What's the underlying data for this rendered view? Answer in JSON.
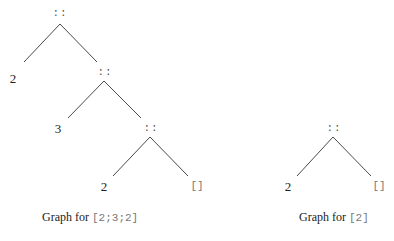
{
  "figures": [
    {
      "id": "tree-left",
      "caption": {
        "prefix": "Graph for ",
        "code": "[2;3;2]"
      },
      "nodes": [
        {
          "label": "::",
          "kind": "cons"
        },
        {
          "label": "2",
          "kind": "num"
        },
        {
          "label": "::",
          "kind": "cons"
        },
        {
          "label": "3",
          "kind": "num"
        },
        {
          "label": "::",
          "kind": "cons"
        },
        {
          "label": "2",
          "kind": "num"
        },
        {
          "label": "[]",
          "kind": "nil"
        }
      ]
    },
    {
      "id": "tree-right",
      "caption": {
        "prefix": "Graph for ",
        "code": "[2]"
      },
      "nodes": [
        {
          "label": "::",
          "kind": "cons"
        },
        {
          "label": "2",
          "kind": "num"
        },
        {
          "label": "[]",
          "kind": "nil"
        }
      ]
    }
  ],
  "colors": {
    "edge": "#4a4a4a",
    "text": "#222222",
    "code": "#777777"
  }
}
